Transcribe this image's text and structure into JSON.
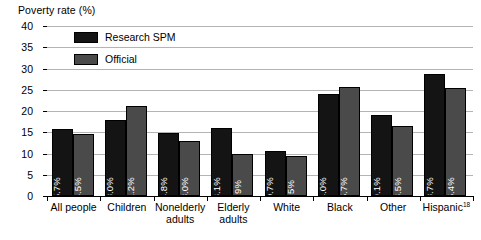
{
  "chart_data": {
    "type": "bar",
    "title": "",
    "ylabel": "Poverty rate (%)",
    "xlabel": "",
    "ylim": [
      0,
      40
    ],
    "ytick_step": 5,
    "yticks": [
      "0",
      "5",
      "10",
      "15",
      "20",
      "25",
      "30",
      "35",
      "40"
    ],
    "grid": true,
    "legend_position": "top-left-inside",
    "categories": [
      "All people",
      "Children",
      "Nonelderly adults",
      "Elderly adults",
      "White",
      "Black",
      "Other",
      "Hispanic"
    ],
    "category_labels": [
      {
        "line1": "All people",
        "line2": "",
        "superscript": ""
      },
      {
        "line1": "Children",
        "line2": "",
        "superscript": ""
      },
      {
        "line1": "Nonelderly",
        "line2": "adults",
        "superscript": ""
      },
      {
        "line1": "Elderly",
        "line2": "adults",
        "superscript": ""
      },
      {
        "line1": "White",
        "line2": "",
        "superscript": ""
      },
      {
        "line1": "Black",
        "line2": "",
        "superscript": ""
      },
      {
        "line1": "Other",
        "line2": "",
        "superscript": ""
      },
      {
        "line1": "Hispanic",
        "line2": "",
        "superscript": "18"
      }
    ],
    "series": [
      {
        "name": "Research SPM",
        "color": "#141414",
        "values": [
          15.7,
          18.0,
          14.8,
          16.1,
          10.7,
          24.0,
          19.1,
          28.7
        ],
        "labels": [
          "15.7%",
          "18.0%",
          "14.8%",
          "16.1%",
          "10.7%",
          "24.0%",
          "19.1%",
          "28.7%"
        ]
      },
      {
        "name": "Official",
        "color": "#4a4a4a",
        "values": [
          14.5,
          21.2,
          13.0,
          9.9,
          9.5,
          25.7,
          16.5,
          25.4
        ],
        "labels": [
          "14.5%",
          "21.2%",
          "13.0%",
          "9.9%",
          "9.5%",
          "25.7%",
          "16.5%",
          "25.4%"
        ]
      }
    ]
  },
  "legend": {
    "items": [
      {
        "label": "Research SPM",
        "swatch": "spm"
      },
      {
        "label": "Official",
        "swatch": "official"
      }
    ]
  },
  "colors": {
    "research_spm": "#141414",
    "official": "#4a4a4a",
    "gridline": "#b4b4b4",
    "axis": "#000000",
    "value_label": "#ffffff",
    "background": "#ffffff"
  }
}
